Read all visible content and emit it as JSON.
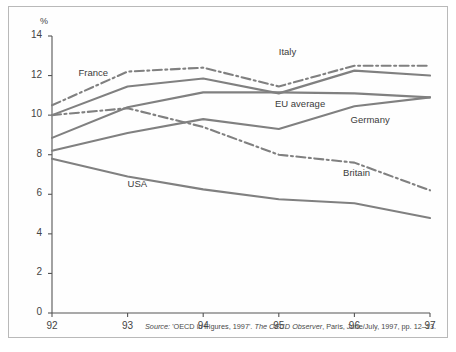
{
  "figure": {
    "y_axis_unit": "%",
    "caption_prefix": "Source:",
    "caption_source_title": "'OECD in Figures, 1997'.",
    "caption_publication": "The OECD Observer",
    "caption_rest": ", Paris, June/July, 1997, pp. 12–13."
  },
  "colors": {
    "line": "#808080",
    "axis": "#555555",
    "frame": "#b9b9b9",
    "text": "#3a3a3a",
    "background": "#ffffff"
  },
  "chart_data": {
    "type": "line",
    "title": "",
    "subtitle": "",
    "xlabel": "",
    "ylabel": "%",
    "x": [
      "92",
      "93",
      "94",
      "95",
      "96",
      "97"
    ],
    "xlim": [
      92,
      97
    ],
    "ylim": [
      0,
      14
    ],
    "yticks": [
      0,
      2,
      4,
      6,
      8,
      10,
      12,
      14
    ],
    "xticks": [
      "92",
      "93",
      "94",
      "95",
      "96",
      "97"
    ],
    "grid": false,
    "legend": "inline-labels",
    "annotations": [
      {
        "text": "France",
        "x": 92.35,
        "y": 12.1
      },
      {
        "text": "Italy",
        "x": 95.0,
        "y": 13.15
      },
      {
        "text": "EU average",
        "x": 94.95,
        "y": 10.5
      },
      {
        "text": "Germany",
        "x": 95.95,
        "y": 9.7
      },
      {
        "text": "Britain",
        "x": 95.85,
        "y": 7.05
      },
      {
        "text": "USA",
        "x": 93.0,
        "y": 6.45
      }
    ],
    "series": [
      {
        "name": "Italy",
        "style": "dash-dot",
        "values": [
          10.5,
          12.2,
          12.4,
          11.45,
          12.5,
          12.5
        ]
      },
      {
        "name": "France",
        "style": "solid",
        "values": [
          10.0,
          11.45,
          11.85,
          11.1,
          12.25,
          12.0
        ]
      },
      {
        "name": "EU average",
        "style": "solid",
        "values": [
          8.85,
          10.4,
          11.15,
          11.15,
          11.1,
          10.9
        ]
      },
      {
        "name": "Britain",
        "style": "dash-dot",
        "values": [
          10.0,
          10.35,
          9.4,
          8.0,
          7.6,
          6.2
        ]
      },
      {
        "name": "Germany",
        "style": "solid",
        "values": [
          8.2,
          9.1,
          9.8,
          9.3,
          10.45,
          10.9
        ]
      },
      {
        "name": "USA",
        "style": "solid",
        "values": [
          7.8,
          6.9,
          6.25,
          5.75,
          5.55,
          4.8
        ]
      }
    ]
  }
}
